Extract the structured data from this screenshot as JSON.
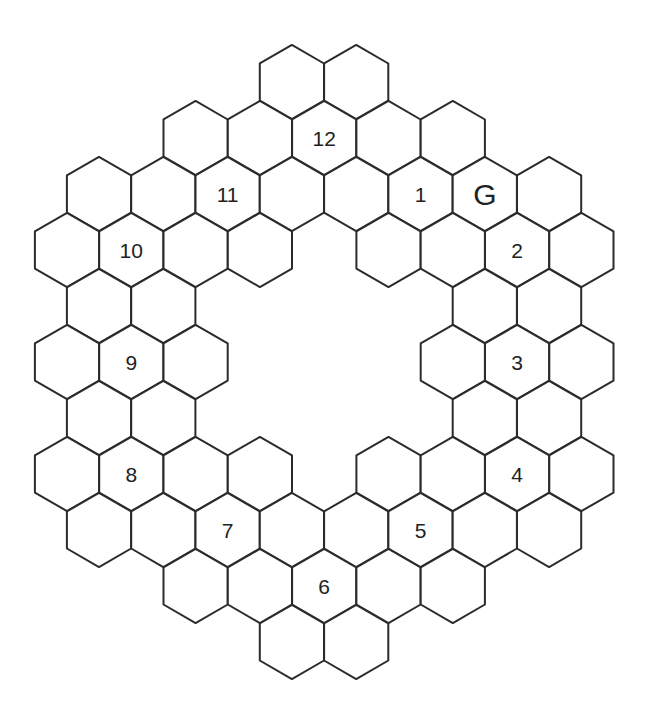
{
  "diagram": {
    "type": "hex-ring-board",
    "orientation": "pointy-top",
    "colors": {
      "line": "#2b2b2b",
      "fill": "#ffffff",
      "text": "#222222"
    },
    "grid": {
      "hex_width": 64.3,
      "hex_radius": 37.1,
      "row_spacing": 56,
      "first_row_center_y": 82,
      "even_row_x0": 99,
      "odd_row_x0": 67
    },
    "rows": [
      {
        "row": 0,
        "cols": [
          3,
          4
        ]
      },
      {
        "row": 1,
        "cols": [
          2,
          3,
          4,
          5,
          6
        ]
      },
      {
        "row": 2,
        "cols": [
          0,
          1,
          2,
          3,
          4,
          5,
          6,
          7
        ]
      },
      {
        "row": 3,
        "cols": [
          0,
          1,
          2,
          3,
          5,
          6,
          7,
          8
        ]
      },
      {
        "row": 4,
        "cols": [
          0,
          1,
          6,
          7
        ]
      },
      {
        "row": 5,
        "cols": [
          0,
          1,
          2,
          6,
          7,
          8
        ]
      },
      {
        "row": 6,
        "cols": [
          0,
          1,
          6,
          7
        ]
      },
      {
        "row": 7,
        "cols": [
          0,
          1,
          2,
          3,
          5,
          6,
          7,
          8
        ]
      },
      {
        "row": 8,
        "cols": [
          0,
          1,
          2,
          3,
          4,
          5,
          6,
          7
        ]
      },
      {
        "row": 9,
        "cols": [
          2,
          3,
          4,
          5,
          6
        ]
      },
      {
        "row": 10,
        "cols": [
          3,
          4
        ]
      }
    ],
    "labels": [
      {
        "text": "12",
        "row": 1,
        "col": 4
      },
      {
        "text": "1",
        "row": 2,
        "col": 5
      },
      {
        "text": "G",
        "row": 2,
        "col": 6,
        "goal": true
      },
      {
        "text": "2",
        "row": 3,
        "col": 7
      },
      {
        "text": "3",
        "row": 5,
        "col": 7
      },
      {
        "text": "4",
        "row": 7,
        "col": 7
      },
      {
        "text": "5",
        "row": 8,
        "col": 5
      },
      {
        "text": "6",
        "row": 9,
        "col": 4
      },
      {
        "text": "7",
        "row": 8,
        "col": 2
      },
      {
        "text": "8",
        "row": 7,
        "col": 1
      },
      {
        "text": "9",
        "row": 5,
        "col": 1
      },
      {
        "text": "10",
        "row": 3,
        "col": 1
      },
      {
        "text": "11",
        "row": 2,
        "col": 2
      }
    ]
  }
}
